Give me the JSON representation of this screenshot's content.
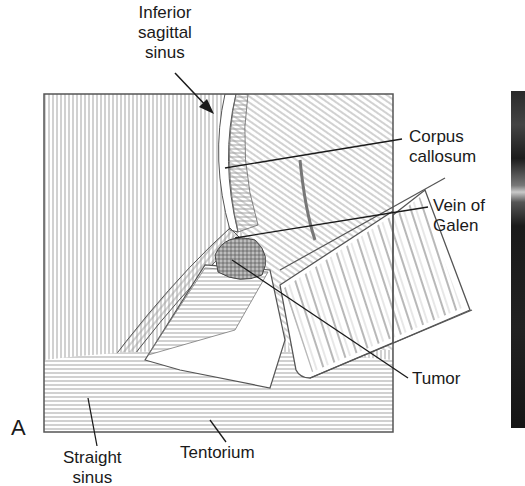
{
  "figure": {
    "panel_letter": "A",
    "labels": {
      "inferior_sagittal_sinus": [
        "Inferior",
        "sagittal",
        "sinus"
      ],
      "corpus_callosum": [
        "Corpus",
        "callosum"
      ],
      "vein_of_galen": [
        "Vein of",
        "Galen"
      ],
      "tumor": "Tumor",
      "straight_sinus": [
        "Straight",
        "sinus"
      ],
      "tentorium": "Tentorium"
    },
    "colors": {
      "ink": "#1a1a1a",
      "hatch": "#8a8a8a",
      "background": "#ffffff",
      "photo_dark": "#1c1c1c"
    }
  }
}
